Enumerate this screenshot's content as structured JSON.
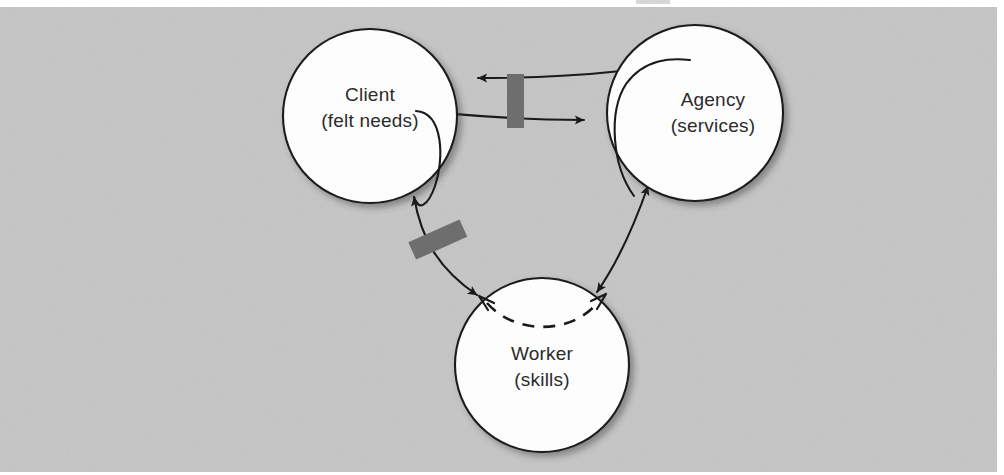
{
  "figure": {
    "background_color": "#c8c8c8",
    "margin_color": "#ffffff",
    "nodes": [
      {
        "id": "client",
        "line1": "Client",
        "line2": "(felt needs)",
        "cx": 370,
        "cy": 116,
        "r": 87
      },
      {
        "id": "agency",
        "line1": "Agency",
        "line2": "(services)",
        "cx": 695,
        "cy": 113,
        "r": 88
      },
      {
        "id": "worker",
        "line1": "Worker",
        "line2": "(skills)",
        "cx": 542,
        "cy": 365,
        "r": 87
      }
    ],
    "connections": [
      {
        "id": "agency-to-client",
        "from": "agency",
        "to": "client",
        "arrowheads": "single-left",
        "style": "solid-curved"
      },
      {
        "id": "client-to-agency",
        "from": "client",
        "to": "agency",
        "arrowheads": "single-right",
        "style": "solid-curved"
      },
      {
        "id": "agency-worker",
        "from": "agency",
        "to": "worker",
        "arrowheads": "double",
        "style": "solid-curved"
      },
      {
        "id": "client-worker",
        "from": "client",
        "to": "worker",
        "arrowheads": "double",
        "style": "solid-curved"
      },
      {
        "id": "worker-internal-arc",
        "from": "worker",
        "to": "worker",
        "arrowheads": "double-hollow",
        "style": "dashed-arc"
      }
    ],
    "barriers": [
      {
        "id": "barrier-client-agency",
        "cx": 516,
        "cy": 101,
        "width": 17,
        "height": 54,
        "rotation": 0,
        "color": "#6e6e6e"
      },
      {
        "id": "barrier-client-worker",
        "cx": 438,
        "cy": 240,
        "width": 56,
        "height": 19,
        "rotation": -24,
        "color": "#6e6e6e"
      }
    ]
  }
}
